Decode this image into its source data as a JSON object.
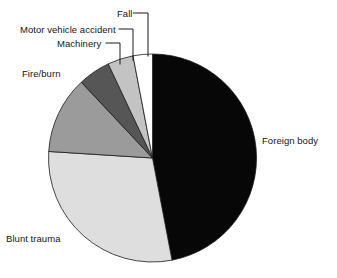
{
  "chart_data": {
    "type": "pie",
    "title": "",
    "subtitle": "",
    "xlabel": "",
    "ylabel": "",
    "legend_position": "none",
    "grid": false,
    "labels_placement": "outside-with-leader-lines",
    "start_angle_deg": 0,
    "direction": "clockwise",
    "categories": [
      "Foreign body",
      "Blunt trauma",
      "Fire/burn",
      "Motor vehicle accident",
      "Machinery",
      "Fall"
    ],
    "values": [
      47,
      29,
      12,
      5,
      4,
      3
    ],
    "units": "percent",
    "slices": [
      {
        "label": "Foreign body",
        "value": 47,
        "color": "#070707",
        "start_angle_deg": 0,
        "end_angle_deg": 169.2
      },
      {
        "label": "Blunt trauma",
        "value": 29,
        "color": "#dedede",
        "start_angle_deg": 169.2,
        "end_angle_deg": 273.6
      },
      {
        "label": "Fire/burn",
        "value": 12,
        "color": "#9b9b9b",
        "start_angle_deg": 273.6,
        "end_angle_deg": 316.8
      },
      {
        "label": "Motor vehicle accident",
        "value": 5,
        "color": "#565656",
        "start_angle_deg": 316.8,
        "end_angle_deg": 334.8
      },
      {
        "label": "Machinery",
        "value": 4,
        "color": "#c3c3c3",
        "start_angle_deg": 334.8,
        "end_angle_deg": 349.2
      },
      {
        "label": "Fall",
        "value": 3,
        "color": "#ffffff",
        "start_angle_deg": 349.2,
        "end_angle_deg": 360
      }
    ]
  },
  "labels": {
    "foreign_body": "Foreign body",
    "blunt_trauma": "Blunt trauma",
    "fire_burn": "Fire/burn",
    "motor_vehicle_accident": "Motor vehicle accident",
    "machinery": "Machinery",
    "fall": "Fall"
  },
  "colors": {
    "foreign_body": "#070707",
    "blunt_trauma": "#dedede",
    "fire_burn": "#9b9b9b",
    "motor_vehicle_accident": "#565656",
    "machinery": "#c3c3c3",
    "fall": "#ffffff",
    "outline": "#1a1a1a",
    "text": "#161616",
    "background": "#ffffff"
  }
}
